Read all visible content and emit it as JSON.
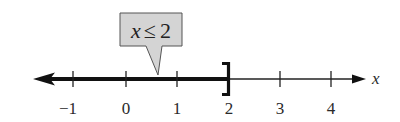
{
  "diagram": {
    "type": "number-line-inequality",
    "inequality": {
      "variable": "x",
      "symbol": "≤",
      "value": "2",
      "text": "x ≤ 2"
    },
    "axis": {
      "label": "x",
      "ticks": [
        {
          "value": -1,
          "label": "−1"
        },
        {
          "value": 0,
          "label": "0"
        },
        {
          "value": 1,
          "label": "1"
        },
        {
          "value": 2,
          "label": "2"
        },
        {
          "value": 3,
          "label": "3"
        },
        {
          "value": 4,
          "label": "4"
        }
      ]
    },
    "solution": {
      "shaded_direction": "left",
      "endpoint": 2,
      "endpoint_style": "closed-bracket ]"
    },
    "colors": {
      "line": "#111111",
      "callout_fill": "#d4d4d4",
      "callout_stroke": "#555555",
      "text": "#2a2a2a"
    }
  }
}
